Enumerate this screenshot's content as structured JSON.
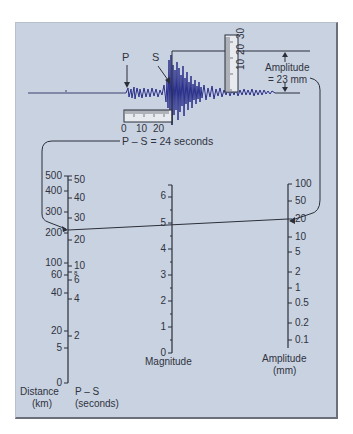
{
  "seismogram": {
    "p_label": "P",
    "s_label": "S",
    "time_ruler_ticks": [
      "0",
      "10",
      "20"
    ],
    "amp_ruler_ticks": [
      "10",
      "20",
      "30"
    ],
    "amplitude_label_line1": "Amplitude",
    "amplitude_label_line2": "= 23 mm",
    "ps_label": "P – S = 24 seconds"
  },
  "nomogram": {
    "distance_axis": {
      "label_line1": "Distance",
      "label_line2": "(km)",
      "ticks": [
        "500",
        "400",
        "300",
        "200",
        "100",
        "60",
        "40",
        "20",
        "5",
        "0"
      ]
    },
    "ps_axis": {
      "label_line1": "P – S",
      "label_line2": "(seconds)",
      "ticks": [
        "50",
        "40",
        "30",
        "20",
        "10",
        "8",
        "6",
        "4",
        "2"
      ]
    },
    "magnitude_axis": {
      "label": "Magnitude",
      "ticks": [
        "6",
        "5",
        "4",
        "3",
        "2",
        "1",
        "0"
      ]
    },
    "amplitude_axis": {
      "label_line1": "Amplitude",
      "label_line2": "(mm)",
      "ticks": [
        "100",
        "50",
        "20",
        "10",
        "5",
        "2",
        "1",
        "0.5",
        "0.2",
        "0.1"
      ]
    }
  },
  "colors": {
    "background": "#c9d2e0",
    "trace": "#2a2f8a",
    "line": "#2b2f3a"
  }
}
